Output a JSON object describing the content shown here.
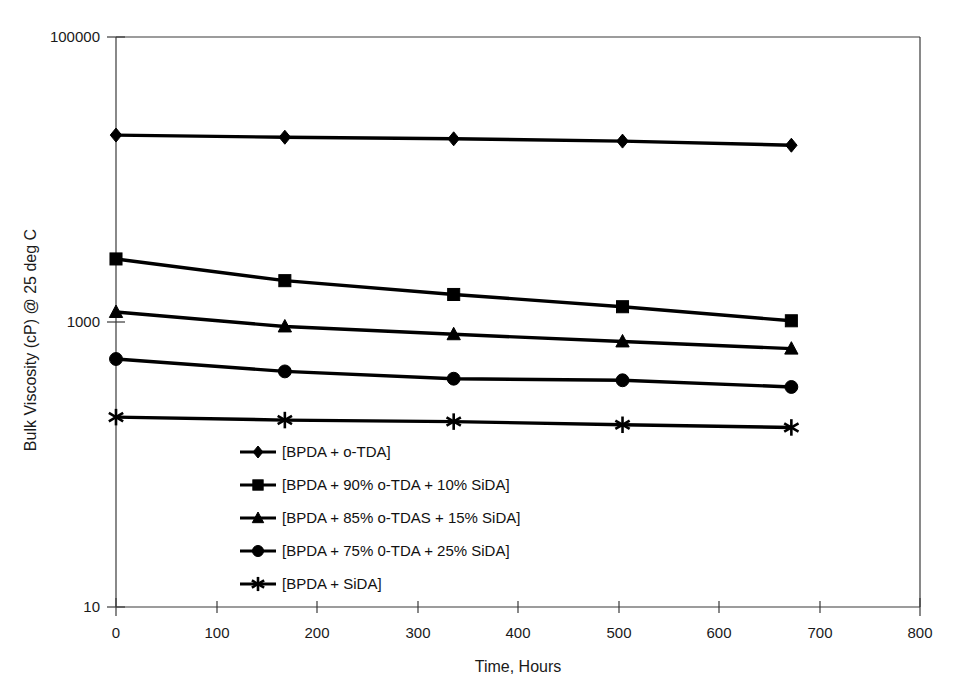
{
  "chart_data": {
    "type": "line",
    "title": "",
    "xlabel": "Time, Hours",
    "ylabel": "Bulk Viscosity (cP) @ 25 deg C",
    "yscale": "log",
    "xlim": [
      0,
      800
    ],
    "ylim": [
      10,
      100000
    ],
    "x": [
      0,
      168,
      336,
      504,
      672
    ],
    "xticks": [
      "0",
      "100",
      "200",
      "300",
      "400",
      "500",
      "600",
      "700",
      "800"
    ],
    "xtick_values": [
      0,
      100,
      200,
      300,
      400,
      500,
      600,
      700,
      800
    ],
    "yticks": [
      "100000",
      "1000",
      "10"
    ],
    "ytick_values": [
      100000,
      1000,
      10
    ],
    "grid": false,
    "legend_position": "inside-lower-left",
    "series": [
      {
        "name": "[BPDA + o-TDA]",
        "marker": "diamond",
        "values": [
          20500,
          19800,
          19300,
          18600,
          17400
        ]
      },
      {
        "name": "[BPDA + 90% o-TDA + 10% SiDA]",
        "marker": "square",
        "values": [
          2770,
          1950,
          1560,
          1280,
          1020
        ]
      },
      {
        "name": "[BPDA + 85% o-TDAS + 15% SiDA]",
        "marker": "triangle",
        "values": [
          1175,
          930,
          820,
          730,
          650
        ]
      },
      {
        "name": "[BPDA + 75% 0-TDA + 25% SiDA]",
        "marker": "circle",
        "values": [
          550,
          450,
          400,
          390,
          350
        ]
      },
      {
        "name": "[BPDA + SiDA]",
        "marker": "star",
        "values": [
          215,
          205,
          200,
          190,
          182
        ]
      }
    ]
  }
}
